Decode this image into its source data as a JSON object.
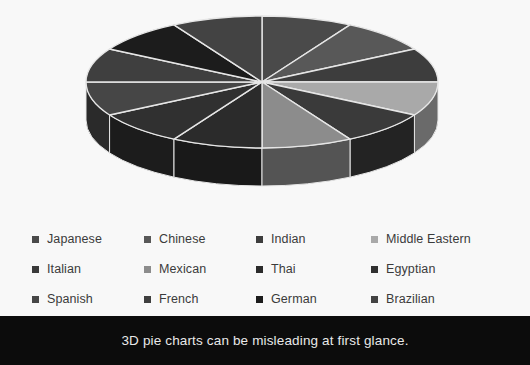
{
  "caption": {
    "text": "3D pie charts can be misleading at first glance."
  },
  "legend": {
    "rows": [
      [
        {
          "label": "Japanese",
          "color": "#4a4a4a"
        },
        {
          "label": "Chinese",
          "color": "#585858"
        },
        {
          "label": "Indian",
          "color": "#3d3d3d"
        },
        {
          "label": "Middle Eastern",
          "color": "#a9a9a9"
        }
      ],
      [
        {
          "label": "Italian",
          "color": "#3a3a3a"
        },
        {
          "label": "Mexican",
          "color": "#8c8c8c"
        },
        {
          "label": "Thai",
          "color": "#2b2b2b"
        },
        {
          "label": "Egyptian",
          "color": "#303030"
        }
      ],
      [
        {
          "label": "Spanish",
          "color": "#464646"
        },
        {
          "label": "French",
          "color": "#3f3f3f"
        },
        {
          "label": "German",
          "color": "#1c1c1c"
        },
        {
          "label": "Brazilian",
          "color": "#434343"
        }
      ]
    ]
  },
  "chart_data": {
    "type": "pie",
    "title": "",
    "style": "3d",
    "legend_position": "bottom",
    "background_color": "#f8f8f8",
    "divider_color": "#e6e6e6",
    "equal_slices": true,
    "slice_angle_degrees": 30,
    "categories": [
      "Japanese",
      "Chinese",
      "Indian",
      "Middle Eastern",
      "Italian",
      "Mexican",
      "Thai",
      "Egyptian",
      "Spanish",
      "French",
      "German",
      "Brazilian"
    ],
    "values": [
      8.333,
      8.333,
      8.333,
      8.333,
      8.333,
      8.333,
      8.333,
      8.333,
      8.333,
      8.333,
      8.333,
      8.333
    ],
    "colors": [
      "#4a4a4a",
      "#585858",
      "#3d3d3d",
      "#a9a9a9",
      "#3a3a3a",
      "#8c8c8c",
      "#2b2b2b",
      "#303030",
      "#464646",
      "#3f3f3f",
      "#1c1c1c",
      "#434343"
    ],
    "side_colors": [
      "#2c2c2c",
      "#343434",
      "#252525",
      "#6a6a6a",
      "#232323",
      "#545454",
      "#191919",
      "#1c1c1c",
      "#2a2a2a",
      "#262626",
      "#101010",
      "#282828"
    ],
    "geometry": {
      "center_x": 262,
      "center_y": 82,
      "radius_x": 176,
      "radius_y": 66,
      "depth": 38,
      "start_angle_degrees": -90
    }
  }
}
